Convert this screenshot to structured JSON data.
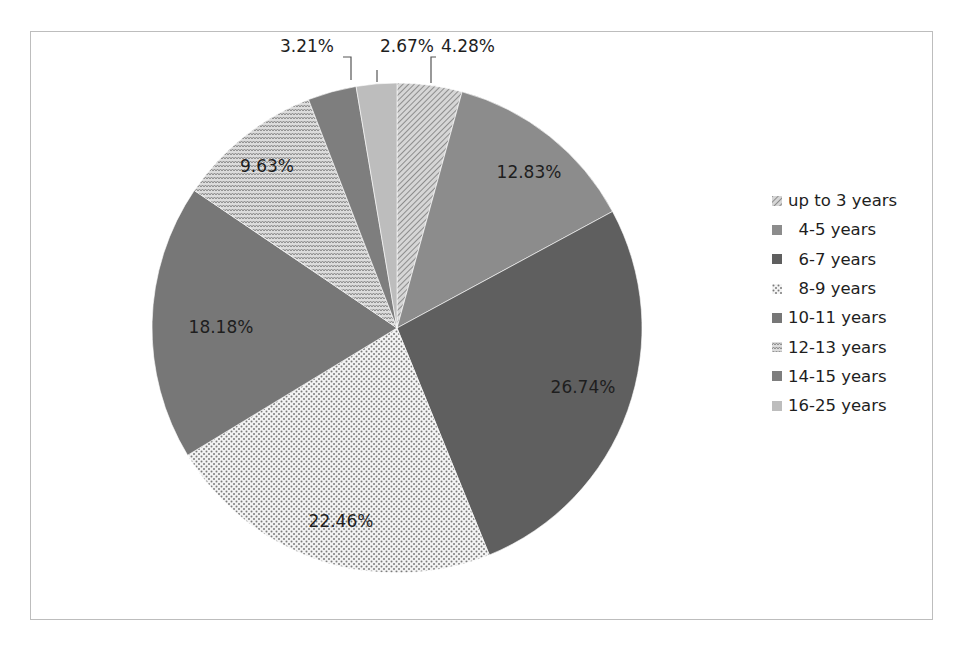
{
  "chart_data": {
    "type": "pie",
    "title": "",
    "start_angle_deg": 0,
    "direction": "clockwise",
    "legend_position": "right",
    "categories": [
      "up to 3 years",
      "4-5 years",
      "6-7 years",
      "8-9 years",
      "10-11 years",
      "12-13 years",
      "14-15 years",
      "16-25 years"
    ],
    "values": [
      4.28,
      12.83,
      26.74,
      22.46,
      18.18,
      9.63,
      3.21,
      2.67
    ],
    "labels": [
      "4.28%",
      "12.83%",
      "26.74%",
      "22.46%",
      "18.18%",
      "9.63%",
      "3.21%",
      "2.67%"
    ],
    "fills": [
      {
        "pattern": "diagonal-lines",
        "color": "#9a9a9a"
      },
      {
        "pattern": "solid",
        "color": "#8c8c8c"
      },
      {
        "pattern": "solid",
        "color": "#5f5f5f"
      },
      {
        "pattern": "dots",
        "color": "#b8b8b8"
      },
      {
        "pattern": "solid",
        "color": "#777777"
      },
      {
        "pattern": "zigzag",
        "color": "#a8a8a8"
      },
      {
        "pattern": "solid",
        "color": "#7e7e7e"
      },
      {
        "pattern": "solid",
        "color": "#bdbdbd"
      }
    ]
  },
  "legend": {
    "items": [
      {
        "label": "up to 3 years"
      },
      {
        "label": "  4-5 years"
      },
      {
        "label": "  6-7 years"
      },
      {
        "label": "  8-9 years"
      },
      {
        "label": "10-11 years"
      },
      {
        "label": "12-13 years"
      },
      {
        "label": "14-15 years"
      },
      {
        "label": "16-25 years"
      }
    ]
  }
}
